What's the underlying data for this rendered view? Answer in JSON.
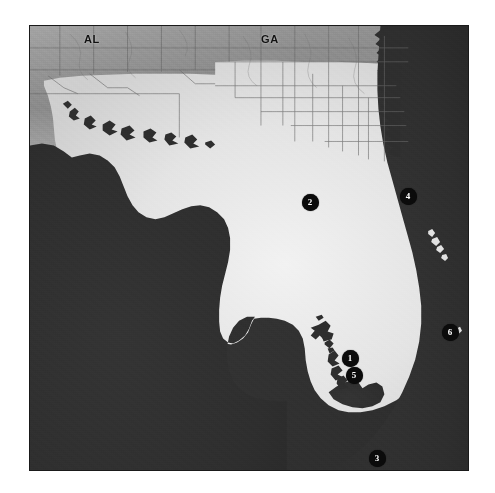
{
  "figure": {
    "domain": "map",
    "background_color": "#ffffff",
    "frame": {
      "x": 29,
      "y": 25,
      "width": 440,
      "height": 446,
      "border_color": "#1a1a1a"
    }
  },
  "map": {
    "region_name": "Florida peninsula and adjacent Gulf / Atlantic waters",
    "projection_note": "shaded-relief grayscale basemap",
    "colors": {
      "water": "#2e2e2e",
      "lowland_land": "#e3e3e3",
      "upland_land": "#8a8a8a",
      "upland_midtone": "#a8a8a8",
      "county_line": "#6a6a6a",
      "marker_fill": "#0b0b0b",
      "marker_text": "#ffffff",
      "label_text": "#111111"
    },
    "state_labels": [
      {
        "id": "AL",
        "text": "AL",
        "x": 84,
        "y": 40
      },
      {
        "id": "GA",
        "text": "GA",
        "x": 261,
        "y": 40
      }
    ],
    "markers": [
      {
        "id": "marker-1",
        "label": "1",
        "x": 350,
        "y": 358
      },
      {
        "id": "marker-2",
        "label": "2",
        "x": 310,
        "y": 202
      },
      {
        "id": "marker-3",
        "label": "3",
        "x": 377,
        "y": 458
      },
      {
        "id": "marker-4",
        "label": "4",
        "x": 408,
        "y": 196
      },
      {
        "id": "marker-5",
        "label": "5",
        "x": 354,
        "y": 375
      },
      {
        "id": "marker-6",
        "label": "6",
        "x": 450,
        "y": 332
      }
    ]
  }
}
